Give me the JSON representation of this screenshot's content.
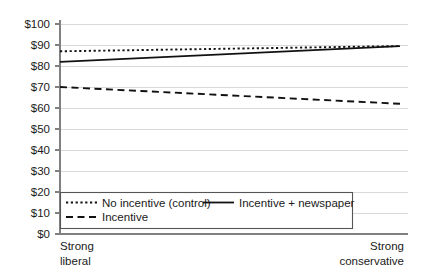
{
  "chart_data": {
    "type": "line",
    "title": "",
    "xlabel": "",
    "ylabel": "",
    "ylim": [
      0,
      100
    ],
    "grid": true,
    "legend_position": "bottom-left-inside",
    "x": [
      0,
      1
    ],
    "xticklabels": [
      "Strong liberal",
      "Strong conservative"
    ],
    "xtick_line1": [
      "Strong",
      "Strong"
    ],
    "xtick_line2": [
      "liberal",
      "conservative"
    ],
    "yticklabels": [
      "$0",
      "$10",
      "$20",
      "$30",
      "$40",
      "$50",
      "$60",
      "$70",
      "$80",
      "$90",
      "$100"
    ],
    "ytickvalues": [
      0,
      10,
      20,
      30,
      40,
      50,
      60,
      70,
      80,
      90,
      100
    ],
    "series": [
      {
        "name": "No incentive (control)",
        "style": "dotted",
        "values": [
          87,
          89.5
        ]
      },
      {
        "name": "Incentive + newspaper",
        "style": "solid",
        "values": [
          82,
          89.5
        ]
      },
      {
        "name": "Incentive",
        "style": "dashed",
        "values": [
          70,
          62
        ]
      }
    ]
  },
  "legend": {
    "entries": [
      {
        "label": "No incentive (control)",
        "style": "dotted"
      },
      {
        "label": "Incentive + newspaper",
        "style": "solid"
      },
      {
        "label": "Incentive",
        "style": "dashed"
      }
    ]
  },
  "colors": {
    "line": "#111111",
    "grid": "#d9d9d9",
    "axis": "#808080",
    "text": "#1a1a1a",
    "background": "#ffffff"
  }
}
